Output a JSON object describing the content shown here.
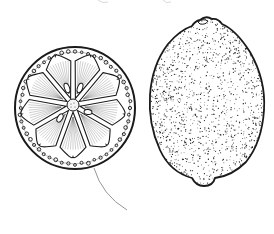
{
  "illustration": {
    "subject": "Lemon botanical line drawing",
    "parts": [
      {
        "name": "cross-section",
        "segments": 9
      },
      {
        "name": "whole-lemon"
      }
    ],
    "colors": {
      "ink": "#1a1a1a",
      "leader_line": "#8a8a8a",
      "background": "#ffffff"
    }
  }
}
